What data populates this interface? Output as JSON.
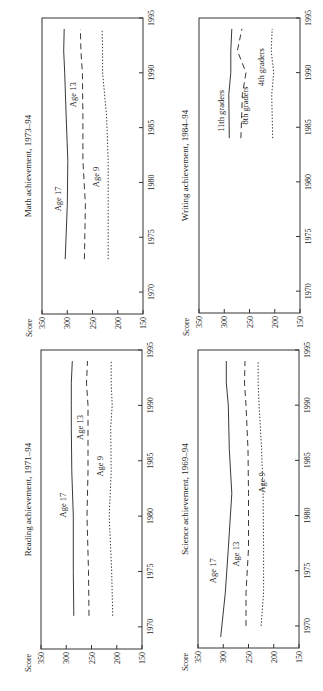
{
  "figure": {
    "orientation": "rotated-90-ccw",
    "common": {
      "ylabel": "Score",
      "ylim": [
        150,
        350
      ],
      "yticks": [
        350,
        300,
        250,
        200,
        150
      ],
      "xticks": [
        1970,
        1975,
        1980,
        1985,
        1990,
        1995
      ],
      "xlim": [
        1968,
        1995
      ]
    }
  },
  "chart_data": [
    {
      "type": "line",
      "title": "Math achievement, 1973–94",
      "xlabel": "",
      "ylabel": "Score",
      "xlim": [
        1968,
        1995
      ],
      "ylim": [
        150,
        350
      ],
      "xticks": [
        1970,
        1975,
        1980,
        1985,
        1990,
        1995
      ],
      "yticks": [
        350,
        300,
        250,
        200,
        150
      ],
      "series": [
        {
          "name": "Age 17",
          "style": "solid",
          "x": [
            1973,
            1978,
            1982,
            1986,
            1990,
            1992,
            1994
          ],
          "values": [
            304,
            300,
            299,
            302,
            305,
            307,
            306
          ],
          "label_at": [
            1978.5,
            312
          ]
        },
        {
          "name": "Age 13",
          "style": "dashed",
          "x": [
            1973,
            1978,
            1982,
            1986,
            1990,
            1992,
            1994
          ],
          "values": [
            266,
            264,
            269,
            269,
            270,
            273,
            274
          ],
          "label_at": [
            1988,
            283
          ]
        },
        {
          "name": "Age 9",
          "style": "dotted",
          "x": [
            1973,
            1978,
            1982,
            1986,
            1990,
            1992,
            1994
          ],
          "values": [
            219,
            219,
            219,
            222,
            230,
            230,
            231
          ],
          "label_at": [
            1980.5,
            238
          ]
        }
      ]
    },
    {
      "type": "line",
      "title": "Writing achievement, 1984–94",
      "xlabel": "",
      "ylabel": "Score",
      "xlim": [
        1968,
        1995
      ],
      "ylim": [
        150,
        350
      ],
      "xticks": [
        1970,
        1975,
        1980,
        1985,
        1990,
        1995
      ],
      "yticks": [
        350,
        300,
        250,
        200,
        150
      ],
      "series": [
        {
          "name": "11th graders",
          "style": "solid",
          "x": [
            1984,
            1988,
            1990,
            1992,
            1994
          ],
          "values": [
            290,
            291,
            287,
            287,
            285
          ],
          "label_at": [
            1986.5,
            300
          ]
        },
        {
          "name": "8th graders",
          "style": "dashed",
          "x": [
            1984,
            1988,
            1990,
            1992,
            1994
          ],
          "values": [
            267,
            264,
            257,
            274,
            265
          ],
          "label_at": [
            1987,
            252
          ]
        },
        {
          "name": "4th graders",
          "style": "dotted",
          "x": [
            1984,
            1988,
            1990,
            1992,
            1994
          ],
          "values": [
            204,
            206,
            202,
            207,
            205
          ],
          "label_at": [
            1990.5,
            222
          ]
        }
      ]
    },
    {
      "type": "line",
      "title": "Reading achievement, 1971–94",
      "xlabel": "",
      "ylabel": "Score",
      "xlim": [
        1968,
        1995
      ],
      "ylim": [
        150,
        350
      ],
      "xticks": [
        1970,
        1975,
        1980,
        1985,
        1990,
        1995
      ],
      "yticks": [
        350,
        300,
        250,
        200,
        150
      ],
      "series": [
        {
          "name": "Age 17",
          "style": "solid",
          "x": [
            1971,
            1975,
            1980,
            1984,
            1988,
            1990,
            1992,
            1994
          ],
          "values": [
            285,
            286,
            286,
            289,
            290,
            290,
            290,
            288
          ],
          "label_at": [
            1981,
            300
          ]
        },
        {
          "name": "Age 13",
          "style": "dashed",
          "x": [
            1971,
            1975,
            1980,
            1984,
            1988,
            1990,
            1992,
            1994
          ],
          "values": [
            255,
            256,
            259,
            257,
            257,
            257,
            260,
            258
          ],
          "label_at": [
            1988,
            266
          ]
        },
        {
          "name": "Age 9",
          "style": "dotted",
          "x": [
            1971,
            1975,
            1980,
            1984,
            1988,
            1990,
            1992,
            1994
          ],
          "values": [
            208,
            210,
            215,
            211,
            212,
            209,
            211,
            211
          ],
          "label_at": [
            1984.5,
            228
          ]
        }
      ]
    },
    {
      "type": "line",
      "title": "Science achievement, 1969–94",
      "xlabel": "",
      "ylabel": "Score",
      "xlim": [
        1968,
        1995
      ],
      "ylim": [
        150,
        350
      ],
      "xticks": [
        1970,
        1975,
        1980,
        1985,
        1990,
        1995
      ],
      "yticks": [
        350,
        300,
        250,
        200,
        150
      ],
      "series": [
        {
          "name": "Age 17",
          "style": "solid",
          "x": [
            1969,
            1973,
            1977,
            1982,
            1986,
            1990,
            1992,
            1994
          ],
          "values": [
            305,
            296,
            290,
            283,
            288,
            290,
            294,
            294
          ],
          "label_at": [
            1975,
            314
          ]
        },
        {
          "name": "Age 13",
          "style": "dashed",
          "x": [
            1970,
            1973,
            1977,
            1982,
            1986,
            1990,
            1992,
            1994
          ],
          "values": [
            255,
            255,
            250,
            250,
            251,
            255,
            258,
            257
          ],
          "label_at": [
            1976.5,
            268
          ]
        },
        {
          "name": "Age 9",
          "style": "dotted",
          "x": [
            1970,
            1973,
            1977,
            1982,
            1986,
            1990,
            1992,
            1994
          ],
          "values": [
            225,
            220,
            220,
            221,
            224,
            229,
            231,
            231
          ],
          "label_at": [
            1983,
            218
          ]
        }
      ]
    }
  ]
}
